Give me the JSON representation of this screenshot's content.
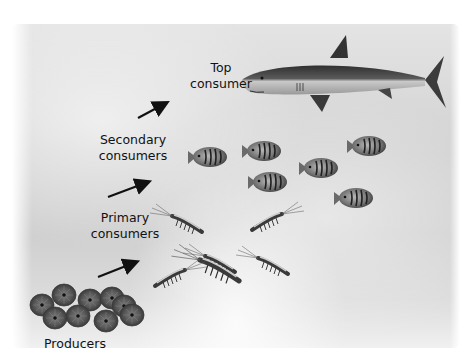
{
  "diagram": {
    "type": "food-chain",
    "levels": [
      {
        "id": "top",
        "label_line1": "Top",
        "label_line2": "consumer",
        "organism": "shark",
        "count": 1
      },
      {
        "id": "secondary",
        "label_line1": "Secondary",
        "label_line2": "consumers",
        "organism": "striped fish",
        "count": 6
      },
      {
        "id": "primary",
        "label_line1": "Primary",
        "label_line2": "consumers",
        "organism": "krill / shrimp",
        "count": 5
      },
      {
        "id": "producers",
        "label_line1": "Producers",
        "organism": "phytoplankton (diatoms)",
        "count": 9
      }
    ],
    "arrows": [
      {
        "from": "primary",
        "to": "secondary"
      },
      {
        "from": "secondary",
        "to": "top"
      },
      {
        "from": "producers",
        "to": "primary"
      }
    ]
  }
}
